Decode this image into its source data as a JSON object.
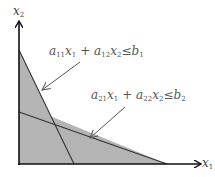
{
  "diagram": {
    "type": "linear-programming-feasible-region",
    "axes": {
      "x_label": "x",
      "x_sub": "1",
      "y_label": "x",
      "y_sub": "2"
    },
    "constraints": [
      {
        "a1": "a",
        "a1_sub": "11",
        "v1": "x",
        "v1_sub": "1",
        "plus": "+",
        "a2": "a",
        "a2_sub": "12",
        "v2": "x",
        "v2_sub": "2",
        "rel": "≤",
        "b": "b",
        "b_sub": "1"
      },
      {
        "a1": "a",
        "a1_sub": "21",
        "v1": "x",
        "v1_sub": "1",
        "plus": "+",
        "a2": "a",
        "a2_sub": "22",
        "v2": "x",
        "v2_sub": "2",
        "rel": "≤",
        "b": "b",
        "b_sub": "2"
      }
    ],
    "colors": {
      "shade": "#b4b4b4",
      "line": "#333333",
      "axis": "#111111",
      "pointer": "#555555"
    }
  }
}
